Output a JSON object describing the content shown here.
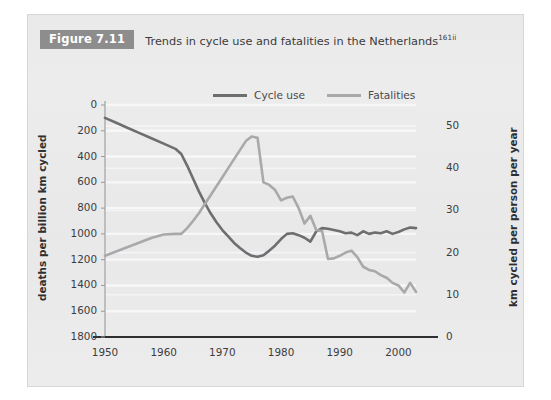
{
  "figure": {
    "tag": "Figure 7.11",
    "caption": "Trends in cycle use and fatalities in the Netherlands",
    "caption_superscript": "161ii"
  },
  "legend": {
    "position": "top-center",
    "items": [
      {
        "label": "Cycle use",
        "color": "#6e6e70",
        "icon": "line-swatch"
      },
      {
        "label": "Fatalities",
        "color": "#a9a9ab",
        "icon": "line-swatch"
      }
    ]
  },
  "axes": {
    "left_title": "deaths per billion km cycled",
    "right_title": "km cycled per person per year",
    "left_ticks": [
      "1800",
      "1600",
      "1400",
      "1200",
      "1000",
      "800",
      "600",
      "400",
      "200",
      "0"
    ],
    "right_ticks": [
      "50",
      "40",
      "30",
      "20",
      "10",
      "0"
    ],
    "x_ticks": [
      "1950",
      "1960",
      "1970",
      "1980",
      "1990",
      "2000"
    ]
  },
  "colors": {
    "panel_background": "#ececed",
    "grid": "#f7f7f8",
    "axis_line": "#2f2f30",
    "cycle_use": "#6e6e70",
    "fatalities": "#a9a9ab",
    "tag_background": "#8d8d8e",
    "text": "#3b3b3c"
  },
  "chart_data": {
    "type": "line",
    "title": "Trends in cycle use and fatalities in the Netherlands",
    "subtitle": "",
    "xlabel": "",
    "ylabel": "deaths per billion km cycled",
    "y2label": "km cycled per person per year",
    "xlim": [
      1950,
      2003
    ],
    "ylim": [
      0,
      1800
    ],
    "y2lim": [
      0,
      55
    ],
    "grid": true,
    "legend_position": "top-center",
    "x_ticks": [
      1950,
      1960,
      1970,
      1980,
      1990,
      2000
    ],
    "y_ticks": [
      0,
      200,
      400,
      600,
      800,
      1000,
      1200,
      1400,
      1600,
      1800
    ],
    "y2_ticks": [
      0,
      10,
      20,
      30,
      40,
      50
    ],
    "series": [
      {
        "name": "Cycle use",
        "axis": "left",
        "color": "#6e6e70",
        "x": [
          1950,
          1952,
          1954,
          1956,
          1958,
          1960,
          1962,
          1963,
          1964,
          1965,
          1966,
          1967,
          1968,
          1969,
          1970,
          1971,
          1972,
          1973,
          1974,
          1975,
          1976,
          1977,
          1978,
          1979,
          1980,
          1981,
          1982,
          1983,
          1984,
          1985,
          1986,
          1987,
          1988,
          1989,
          1990,
          1991,
          1992,
          1993,
          1994,
          1995,
          1996,
          1997,
          1998,
          1999,
          2000,
          2001,
          2002,
          2003
        ],
        "values": [
          1700,
          1660,
          1620,
          1580,
          1540,
          1500,
          1460,
          1420,
          1330,
          1230,
          1130,
          1040,
          960,
          890,
          830,
          780,
          730,
          690,
          655,
          630,
          622,
          635,
          670,
          710,
          760,
          800,
          805,
          790,
          770,
          740,
          820,
          845,
          840,
          830,
          820,
          805,
          810,
          790,
          820,
          800,
          810,
          805,
          820,
          800,
          815,
          835,
          850,
          845
        ]
      },
      {
        "name": "Fatalities",
        "axis": "left",
        "color": "#a9a9ab",
        "x": [
          1950,
          1952,
          1954,
          1956,
          1958,
          1960,
          1962,
          1963,
          1964,
          1965,
          1966,
          1967,
          1968,
          1969,
          1970,
          1971,
          1972,
          1973,
          1974,
          1975,
          1976,
          1977,
          1978,
          1979,
          1980,
          1981,
          1982,
          1983,
          1984,
          1985,
          1986,
          1987,
          1988,
          1989,
          1990,
          1991,
          1992,
          1993,
          1994,
          1995,
          1996,
          1997,
          1998,
          1999,
          2000,
          2001,
          2002,
          2003
        ],
        "values": [
          630,
          665,
          700,
          735,
          770,
          795,
          800,
          800,
          845,
          900,
          960,
          1030,
          1100,
          1170,
          1240,
          1310,
          1380,
          1450,
          1520,
          1555,
          1545,
          1200,
          1180,
          1140,
          1060,
          1080,
          1090,
          1000,
          880,
          940,
          830,
          820,
          605,
          610,
          630,
          655,
          670,
          620,
          545,
          520,
          510,
          480,
          460,
          420,
          400,
          345,
          420,
          350
        ]
      }
    ]
  }
}
